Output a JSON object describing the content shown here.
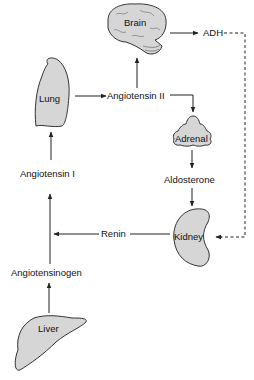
{
  "diagram": {
    "type": "flowchart",
    "nodes": {
      "brain": "Brain",
      "adh": "ADH",
      "lung": "Lung",
      "angiotensin_ii": "Angiotensin II",
      "adrenal": "Adrenal",
      "aldosterone": "Aldosterone",
      "angiotensin_i": "Angiotensin I",
      "kidney": "Kidney",
      "renin": "Renin",
      "angiotensinogen": "Angiotensinogen",
      "liver": "Liver"
    },
    "edges": [
      {
        "from": "Liver",
        "to": "Angiotensinogen",
        "style": "solid"
      },
      {
        "from": "Angiotensinogen",
        "to": "Angiotensin I",
        "style": "solid"
      },
      {
        "from": "Angiotensin I",
        "to": "Lung",
        "style": "solid"
      },
      {
        "from": "Lung",
        "to": "Angiotensin II",
        "style": "solid"
      },
      {
        "from": "Angiotensin II",
        "to": "Brain",
        "style": "solid"
      },
      {
        "from": "Angiotensin II",
        "to": "Adrenal",
        "style": "solid"
      },
      {
        "from": "Brain",
        "to": "ADH",
        "style": "solid"
      },
      {
        "from": "ADH",
        "to": "Kidney",
        "style": "dashed"
      },
      {
        "from": "Adrenal",
        "to": "Aldosterone",
        "style": "solid"
      },
      {
        "from": "Aldosterone",
        "to": "Kidney",
        "style": "solid"
      },
      {
        "from": "Kidney",
        "to": "Renin",
        "style": "solid"
      },
      {
        "from": "Renin",
        "to": "Angiotensinogen line",
        "style": "solid"
      }
    ],
    "colors": {
      "organ_fill": "#d6d6d6",
      "stroke": "#222222"
    }
  }
}
